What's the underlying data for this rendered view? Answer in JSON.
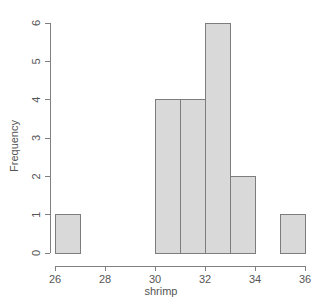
{
  "chart_data": {
    "type": "bar",
    "chart_subtype": "histogram",
    "title": "",
    "subtitle": "",
    "xlabel": "shrimp",
    "ylabel": "Frequency",
    "xlim": [
      26,
      36
    ],
    "ylim": [
      0,
      6
    ],
    "xticks": [
      26,
      28,
      30,
      32,
      34,
      36
    ],
    "xtick_labels": [
      "26",
      "28",
      "30",
      "32",
      "34",
      "36"
    ],
    "yticks": [
      0,
      1,
      2,
      3,
      4,
      5,
      6
    ],
    "ytick_labels": [
      "0",
      "1",
      "2",
      "3",
      "4",
      "5",
      "6"
    ],
    "grid": false,
    "legend": null,
    "legend_position": "none",
    "bin_width": 1,
    "bin_edges": [
      26,
      27,
      28,
      29,
      30,
      31,
      32,
      33,
      34,
      35,
      36
    ],
    "categories": [
      "26-27",
      "27-28",
      "28-29",
      "29-30",
      "30-31",
      "31-32",
      "32-33",
      "33-34",
      "34-35",
      "35-36"
    ],
    "values": [
      1,
      0,
      0,
      0,
      4,
      4,
      6,
      2,
      0,
      1
    ],
    "bars": [
      {
        "x0": 26,
        "x1": 27,
        "value": 1
      },
      {
        "x0": 27,
        "x1": 28,
        "value": 0
      },
      {
        "x0": 28,
        "x1": 29,
        "value": 0
      },
      {
        "x0": 29,
        "x1": 30,
        "value": 0
      },
      {
        "x0": 30,
        "x1": 31,
        "value": 4
      },
      {
        "x0": 31,
        "x1": 32,
        "value": 4
      },
      {
        "x0": 32,
        "x1": 33,
        "value": 6
      },
      {
        "x0": 33,
        "x1": 34,
        "value": 2
      },
      {
        "x0": 34,
        "x1": 35,
        "value": 0
      },
      {
        "x0": 35,
        "x1": 36,
        "value": 1
      }
    ],
    "colors": {
      "bar_fill": "#d9d9d9",
      "bar_stroke": "#7d7d7d",
      "axis": "#808080",
      "text": "#555555",
      "background": "#ffffff"
    }
  }
}
